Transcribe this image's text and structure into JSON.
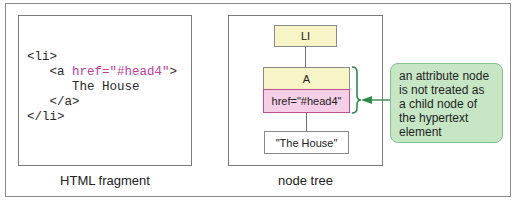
{
  "html_fragment": {
    "caption": "HTML fragment",
    "code_lines": {
      "l1": "<li>",
      "l2_tag_open": "   <a ",
      "l2_attr": "href=\"#head4\"",
      "l2_tag_close": ">",
      "l3": "      The House",
      "l4": "   </a>",
      "l5": "</li>"
    }
  },
  "node_tree": {
    "caption": "node tree",
    "nodes": {
      "li": "LI",
      "a": "A",
      "href": "href=\"#head4\"",
      "text": "\"The House\""
    }
  },
  "callout": {
    "text": "an attribute node is not treated as a child node of the hypertext element"
  },
  "colors": {
    "element_node_fill": "#f7f4c8",
    "attribute_node_fill": "#f5cfe6",
    "attribute_node_border": "#c0508f",
    "attribute_code": "#c23c9c",
    "callout_fill": "#c7e6c5",
    "callout_border": "#86c08c",
    "arrow": "#2f8a4a"
  }
}
